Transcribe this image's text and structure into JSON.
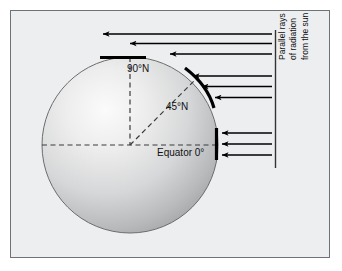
{
  "figure": {
    "background_color": "#edeef0",
    "frame_color": "#6e7175",
    "page_background": "#ffffff"
  },
  "labels": {
    "pole": "90°N",
    "mid_latitude": "45°N",
    "equator": "Equator 0°"
  },
  "caption": {
    "line1": "Parallel rays",
    "line2": "of radiation",
    "line3": "from the sun"
  },
  "globe": {
    "center_x": 130,
    "center_y": 145,
    "radius": 88,
    "fill_light": "#f2f2f2",
    "fill_mid": "#cfd0d1",
    "fill_dark": "#9b9da0",
    "outline_color": "#6b6d70"
  },
  "guides": {
    "dash_color": "#3b3b3b",
    "equator_axis": {
      "from_x": 42,
      "to_x": 218,
      "y": 145
    },
    "polar_axis": {
      "x": 130,
      "from_y": 57,
      "to_y": 145
    },
    "forty_five_axis": {
      "from_x": 130,
      "from_y": 145,
      "to_x": 193,
      "to_y": 82
    }
  },
  "incidence_bands": [
    {
      "name": "polar-band",
      "label": "90°N",
      "kind": "flat-bar",
      "x1": 100,
      "y1": 57,
      "x2": 146,
      "y2": 57,
      "stroke_width": 3.2,
      "color": "#000000",
      "spread_note": "rays spread over widest surface area"
    },
    {
      "name": "mid-latitude-band",
      "label": "45°N",
      "kind": "arc",
      "path": "M 185 68 Q 208 85 214 108",
      "stroke_width": 3.2,
      "color": "#000000",
      "spread_note": "rays spread over intermediate area"
    },
    {
      "name": "equatorial-band",
      "label": "Equator 0°",
      "kind": "vertical-bar",
      "x1": 216,
      "y1": 128,
      "x2": 216,
      "y2": 160,
      "stroke_width": 3.2,
      "color": "#000000",
      "spread_note": "rays concentrated on smallest area"
    }
  ],
  "ray_groups": [
    {
      "name": "polar-rays",
      "target": "90°N",
      "count": 3,
      "color": "#000000",
      "direction": "right-to-left",
      "rays": [
        {
          "tail_x": 272,
          "tip_x": 100,
          "y": 34
        },
        {
          "tail_x": 272,
          "tip_x": 127,
          "y": 43.5
        },
        {
          "tail_x": 272,
          "tip_x": 167,
          "y": 54
        }
      ]
    },
    {
      "name": "mid-latitude-rays",
      "target": "45°N",
      "count": 3,
      "color": "#000000",
      "direction": "right-to-left",
      "rays": [
        {
          "tail_x": 272,
          "tip_x": 190,
          "y": 76
        },
        {
          "tail_x": 272,
          "tip_x": 199,
          "y": 86.5
        },
        {
          "tail_x": 272,
          "tip_x": 212,
          "y": 97.5
        }
      ]
    },
    {
      "name": "equatorial-rays",
      "target": "Equator 0°",
      "count": 3,
      "color": "#000000",
      "direction": "right-to-left",
      "rays": [
        {
          "tail_x": 272,
          "tip_x": 219,
          "y": 133
        },
        {
          "tail_x": 272,
          "tip_x": 219,
          "y": 144
        },
        {
          "tail_x": 272,
          "tip_x": 219,
          "y": 155
        }
      ]
    }
  ],
  "bracket": {
    "name": "radiation-source-bracket",
    "x": 275,
    "top_y": 30,
    "bottom_y": 168,
    "color": "#333333",
    "stroke_width": 1.4
  }
}
